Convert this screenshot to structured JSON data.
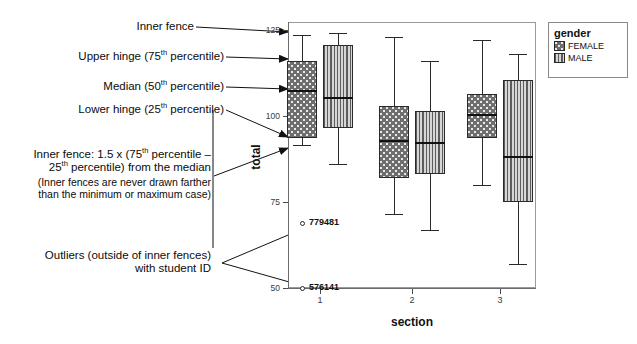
{
  "annotations": {
    "inner_fence_top": "Inner fence",
    "upper_hinge": "Upper hinge (75th percentile)",
    "median": "Median (50th percentile)",
    "lower_hinge": "Lower hinge (25th percentile)",
    "inner_fence_def_line1": "Inner fence: 1.5 x (75th percentile –",
    "inner_fence_def_line2": "25th percentile) from the median",
    "inner_fence_note_line1": "(Inner fences are never drawn farther",
    "inner_fence_note_line2": "than the minimum or maximum case)",
    "outliers_line1": "Outliers (outside of inner fences)",
    "outliers_line2": "with student ID"
  },
  "legend": {
    "title": "gender",
    "entries": [
      {
        "label": "FEMALE",
        "pattern": "dotted",
        "color": "#6e6e6e"
      },
      {
        "label": "MALE",
        "pattern": "vertical-stripes",
        "color": "#8f8f8f"
      }
    ]
  },
  "axes": {
    "y_title": "total",
    "y_ticks": [
      "125",
      "100",
      "75",
      "50"
    ],
    "x_title": "section",
    "x_ticks": [
      "1",
      "2",
      "3"
    ]
  },
  "outliers": [
    {
      "id": "779481",
      "section": "1",
      "gender": "FEMALE",
      "value": 69
    },
    {
      "id": "576141",
      "section": "1",
      "gender": "FEMALE",
      "value": 50
    }
  ],
  "chart_data": {
    "type": "box",
    "title": "",
    "xlabel": "section",
    "ylabel": "total",
    "ylim": [
      45,
      130
    ],
    "grid": false,
    "legend_position": "right",
    "categories": [
      "1",
      "2",
      "3"
    ],
    "series": [
      {
        "name": "FEMALE",
        "color": "#6e6e6e",
        "pattern": "dotted",
        "boxes": [
          {
            "category": "1",
            "whisker_low": 91.5,
            "q1": 93.5,
            "median": 107.5,
            "q3": 116.0,
            "whisker_high": 123.5
          },
          {
            "category": "2",
            "whisker_low": 71.5,
            "q1": 82.0,
            "median": 93.0,
            "q3": 103.0,
            "whisker_high": 123.0
          },
          {
            "category": "3",
            "whisker_low": 80.0,
            "q1": 93.5,
            "median": 100.5,
            "q3": 106.5,
            "whisker_high": 122.0
          }
        ]
      },
      {
        "name": "MALE",
        "color": "#8f8f8f",
        "pattern": "vertical-stripes",
        "boxes": [
          {
            "category": "1",
            "whisker_low": 86.0,
            "q1": 96.5,
            "median": 105.5,
            "q3": 120.5,
            "whisker_high": 124.0
          },
          {
            "category": "2",
            "whisker_low": 67.0,
            "q1": 83.0,
            "median": 92.5,
            "q3": 101.5,
            "whisker_high": 116.0
          },
          {
            "category": "3",
            "whisker_low": 57.0,
            "q1": 75.0,
            "median": 88.5,
            "q3": 110.5,
            "whisker_high": 118.0
          }
        ]
      }
    ]
  }
}
